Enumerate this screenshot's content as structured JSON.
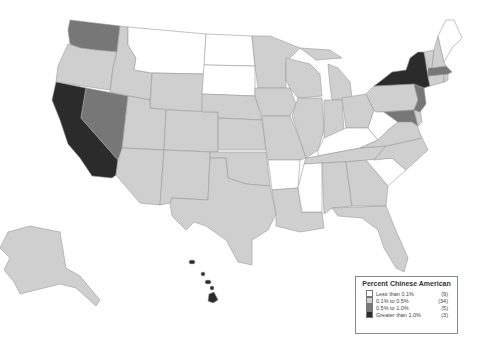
{
  "map": {
    "title": "Percent Chinese American",
    "colors": {
      "lt01": "#ffffff",
      "b01_05": "#cfcfcf",
      "b05_10": "#777777",
      "gt10": "#2b2b2b",
      "border": "#9a9a9a"
    },
    "legend": {
      "title": "Percent Chinese American",
      "items": [
        {
          "label": "Less than 0.1%",
          "count": "(9)",
          "color": "#ffffff"
        },
        {
          "label": "0.1% to 0.5%",
          "count": "(34)",
          "color": "#cfcfcf"
        },
        {
          "label": "0.5% to 1.0%",
          "count": "(5)",
          "color": "#777777"
        },
        {
          "label": "Greater than 1.0%",
          "count": "(3)",
          "color": "#2b2b2b"
        }
      ]
    },
    "categories": {
      "less_than_0_1": [
        "Montana",
        "North Dakota",
        "South Dakota",
        "Arkansas",
        "Mississippi",
        "Kentucky",
        "West Virginia",
        "South Carolina",
        "Maine"
      ],
      "0_5_to_1_0": [
        "Washington",
        "Nevada",
        "Massachusetts",
        "New Jersey",
        "Maryland"
      ],
      "greater_than_1_0": [
        "California",
        "New York",
        "Hawaii"
      ],
      "0_1_to_0_5": "all remaining states"
    }
  }
}
